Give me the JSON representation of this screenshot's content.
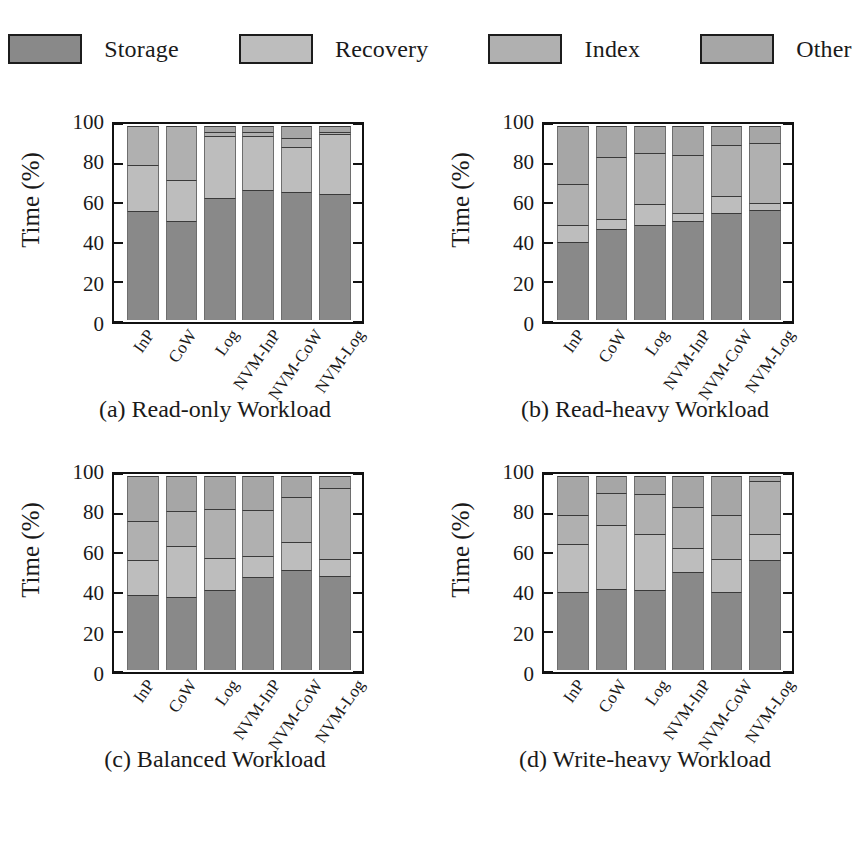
{
  "figure": {
    "legend": [
      {
        "name": "Storage",
        "color": "#898989"
      },
      {
        "name": "Recovery",
        "color": "#bdbdbd"
      },
      {
        "name": "Index",
        "color": "#b0b0b0"
      },
      {
        "name": "Other",
        "color": "#a6a6a6"
      }
    ]
  },
  "chart_data": [
    {
      "type": "bar",
      "id": "a",
      "title": "(a) Read-only Workload",
      "stacked": true,
      "xlabel": "",
      "ylabel": "Time (%)",
      "ylim": [
        0,
        100
      ],
      "yticks": [
        0,
        20,
        40,
        60,
        80,
        100
      ],
      "grid": false,
      "legend_position": "top",
      "categories": [
        "InP",
        "CoW",
        "Log",
        "NVM-InP",
        "NVM-CoW",
        "NVM-Log"
      ],
      "series": [
        {
          "name": "Storage",
          "values": [
            56,
            51,
            63,
            67,
            66,
            65
          ]
        },
        {
          "name": "Recovery",
          "values": [
            24,
            21,
            32,
            28,
            23,
            31
          ]
        },
        {
          "name": "Index",
          "values": [
            20,
            28,
            2,
            2,
            5,
            1
          ]
        },
        {
          "name": "Other",
          "values": [
            0,
            0,
            3,
            3,
            6,
            3
          ]
        }
      ]
    },
    {
      "type": "bar",
      "id": "b",
      "title": "(b) Read-heavy Workload",
      "stacked": true,
      "xlabel": "",
      "ylabel": "Time (%)",
      "ylim": [
        0,
        100
      ],
      "yticks": [
        0,
        20,
        40,
        60,
        80,
        100
      ],
      "grid": false,
      "legend_position": "top",
      "categories": [
        "InP",
        "CoW",
        "Log",
        "NVM-InP",
        "NVM-CoW",
        "NVM-Log"
      ],
      "series": [
        {
          "name": "Storage",
          "values": [
            40,
            47,
            49,
            51,
            55,
            56.5
          ]
        },
        {
          "name": "Recovery",
          "values": [
            9,
            5,
            11,
            4,
            9,
            4
          ]
        },
        {
          "name": "Index",
          "values": [
            21,
            32,
            26,
            30,
            26,
            30.5
          ]
        },
        {
          "name": "Other",
          "values": [
            30,
            16,
            14,
            15,
            10,
            9
          ]
        }
      ]
    },
    {
      "type": "bar",
      "id": "c",
      "title": "(c) Balanced Workload",
      "stacked": true,
      "xlabel": "",
      "ylabel": "Time (%)",
      "ylim": [
        0,
        100
      ],
      "yticks": [
        0,
        20,
        40,
        60,
        80,
        100
      ],
      "grid": false,
      "legend_position": "top",
      "categories": [
        "InP",
        "CoW",
        "Log",
        "NVM-InP",
        "NVM-CoW",
        "NVM-Log"
      ],
      "series": [
        {
          "name": "Storage",
          "values": [
            38.5,
            37.5,
            41.5,
            48,
            51.5,
            48.5
          ]
        },
        {
          "name": "Recovery",
          "values": [
            18,
            26.5,
            16.5,
            11,
            14.5,
            8.5
          ]
        },
        {
          "name": "Index",
          "values": [
            20.5,
            18,
            25,
            23.5,
            23,
            37
          ]
        },
        {
          "name": "Other",
          "values": [
            23,
            18,
            17,
            17.5,
            11,
            6
          ]
        }
      ]
    },
    {
      "type": "bar",
      "id": "d",
      "title": "(d) Write-heavy Workload",
      "stacked": true,
      "xlabel": "",
      "ylabel": "Time (%)",
      "ylim": [
        0,
        100
      ],
      "yticks": [
        0,
        20,
        40,
        60,
        80,
        100
      ],
      "grid": false,
      "legend_position": "top",
      "categories": [
        "InP",
        "CoW",
        "Log",
        "NVM-InP",
        "NVM-CoW",
        "NVM-Log"
      ],
      "series": [
        {
          "name": "Storage",
          "values": [
            40,
            42,
            41,
            50.5,
            40,
            56.5
          ]
        },
        {
          "name": "Recovery",
          "values": [
            25,
            33,
            29,
            12.5,
            17,
            13.5
          ]
        },
        {
          "name": "Index",
          "values": [
            15,
            16,
            20.5,
            21,
            23,
            27.5
          ]
        },
        {
          "name": "Other",
          "values": [
            20,
            9,
            9.5,
            16,
            20,
            2.5
          ]
        }
      ]
    }
  ]
}
